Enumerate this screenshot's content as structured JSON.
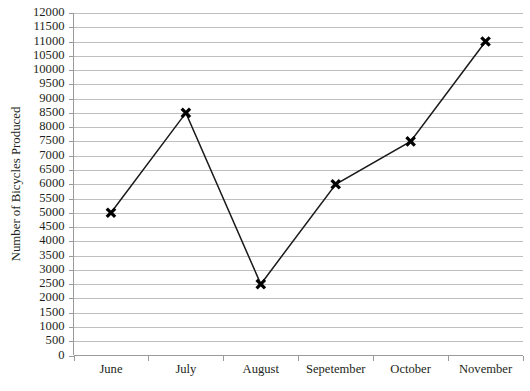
{
  "chart_data": {
    "type": "line",
    "title": "",
    "subtitle": "",
    "xlabel": "",
    "ylabel": "Number of Bicycles Produced",
    "categories": [
      "June",
      "July",
      "August",
      "Sepetember",
      "October",
      "November"
    ],
    "values": [
      5000,
      8500,
      2500,
      6000,
      7500,
      11000
    ],
    "series": [
      {
        "name": "Number of Bicycles Produced",
        "values": [
          5000,
          8500,
          2500,
          6000,
          7500,
          11000
        ]
      }
    ],
    "ylim": [
      0,
      12000
    ],
    "ytick_step": 500,
    "ytick_labels": [
      "0",
      "500",
      "1000",
      "1500",
      "2000",
      "2500",
      "3000",
      "3500",
      "4000",
      "4500",
      "5000",
      "5500",
      "6000",
      "6500",
      "7000",
      "7500",
      "8000",
      "8500",
      "9000",
      "9500",
      "10000",
      "10500",
      "11000",
      "11500",
      "12000"
    ],
    "grid": {
      "horizontal": true,
      "vertical": false,
      "color": "#bfbfbf"
    },
    "legend": {
      "visible": false,
      "position": "none",
      "entries": []
    },
    "annotations": [],
    "marker_style": "x",
    "marker_color": "#000000",
    "line_color": "#1a1a1a",
    "background_color": "#ffffff",
    "axis_color": "#9a9a9a"
  }
}
